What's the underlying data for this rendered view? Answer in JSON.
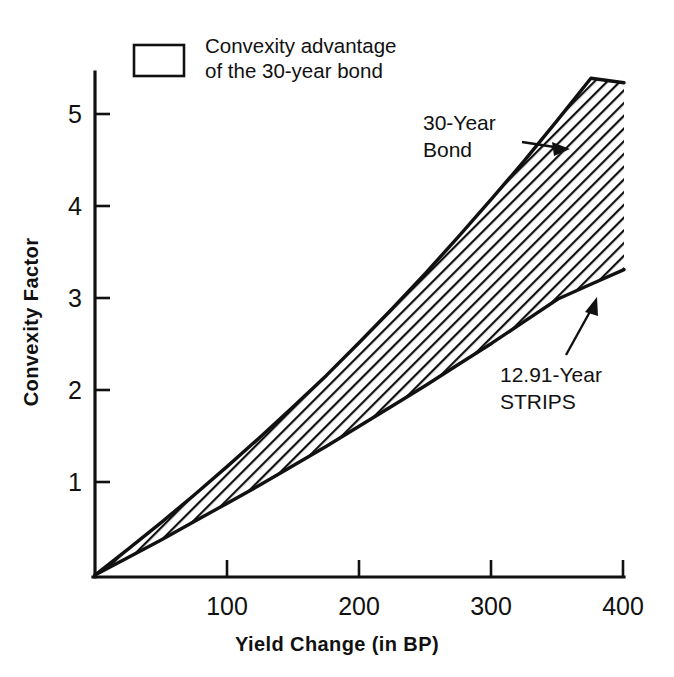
{
  "chart_data": {
    "type": "area",
    "title": "",
    "xlabel": "Yield Change (in BP)",
    "ylabel": "Convexity Factor",
    "xlim": [
      0,
      400
    ],
    "ylim": [
      0,
      5.6
    ],
    "xticks": [
      100,
      200,
      300,
      400
    ],
    "yticks": [
      1,
      2,
      3,
      4,
      5
    ],
    "grid": false,
    "x": [
      0,
      25,
      50,
      75,
      100,
      125,
      150,
      175,
      200,
      225,
      250,
      275,
      300,
      325,
      350,
      375,
      400
    ],
    "series": [
      {
        "name": "30-Year Bond",
        "values": [
          0,
          0.28,
          0.57,
          0.87,
          1.18,
          1.5,
          1.83,
          2.17,
          2.53,
          2.9,
          3.28,
          3.68,
          4.09,
          4.51,
          4.95,
          5.4,
          5.35
        ]
      },
      {
        "name": "12.91-Year STRIPS",
        "values": [
          0,
          0.19,
          0.38,
          0.58,
          0.78,
          0.98,
          1.19,
          1.4,
          1.62,
          1.84,
          2.06,
          2.29,
          2.52,
          2.76,
          3.0,
          3.16,
          3.32
        ]
      }
    ],
    "band": {
      "label": "Convexity advantage of the 30-year bond",
      "upper_series": "30-Year Bond",
      "lower_series": "12.91-Year STRIPS",
      "fill": "hatch-diagonal"
    },
    "endpoint_values": {
      "30-Year Bond": 5.35,
      "12.91-Year STRIPS": 3.32
    },
    "colors": {
      "ink": "#111111",
      "background": "#ffffff",
      "hatch": "#111111"
    }
  },
  "legend": {
    "line1": "Convexity advantage",
    "line2": "of the 30-year bond",
    "swatch_name": "hatched-square"
  },
  "annotations": [
    {
      "id": "bond",
      "line1": "30-Year",
      "line2": "Bond"
    },
    {
      "id": "strips",
      "line1": "12.91-Year",
      "line2": "STRIPS"
    }
  ],
  "axes": {
    "x_title": "Yield Change (in BP)",
    "y_title": "Convexity Factor",
    "x_tick_labels": [
      "100",
      "200",
      "300",
      "400"
    ],
    "y_tick_labels": [
      "1",
      "2",
      "3",
      "4",
      "5"
    ]
  }
}
